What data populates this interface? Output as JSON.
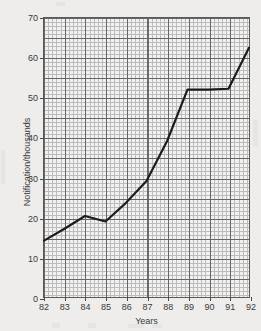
{
  "chart_data": {
    "type": "line",
    "title": "",
    "xlabel": "Years",
    "ylabel": "Notification/thousands",
    "categories": [
      "82",
      "83",
      "84",
      "85",
      "86",
      "87",
      "88",
      "89",
      "90",
      "91",
      "92"
    ],
    "x": [
      82,
      83,
      84,
      85,
      86,
      87,
      88,
      89,
      90,
      91,
      92
    ],
    "values": [
      14,
      17,
      20.2,
      18.8,
      23.5,
      29,
      39,
      52,
      52,
      52.2,
      62.5
    ],
    "series": [
      {
        "name": "Notifications",
        "values": [
          14,
          17,
          20.2,
          18.8,
          23.5,
          29,
          39,
          52,
          52,
          52.2,
          62.5
        ]
      }
    ],
    "xlim": [
      82,
      92
    ],
    "ylim": [
      0,
      70
    ],
    "ytick_labels": [
      "0",
      "10",
      "20",
      "30",
      "40",
      "50",
      "60",
      "70"
    ],
    "ytick_values": [
      0,
      10,
      20,
      30,
      40,
      50,
      60,
      70
    ],
    "xtick_labels": [
      "82",
      "83",
      "84",
      "85",
      "86",
      "87",
      "88",
      "89",
      "90",
      "91",
      "92"
    ],
    "grid": "major-and-minor",
    "legend": "none",
    "line_color": "#1c1c1c",
    "grid_color": "#9d9d9d",
    "grid_major_color": "#4f4f4f",
    "background_color": "#eeedeb",
    "plot_background_color": "#f2f1ef"
  }
}
